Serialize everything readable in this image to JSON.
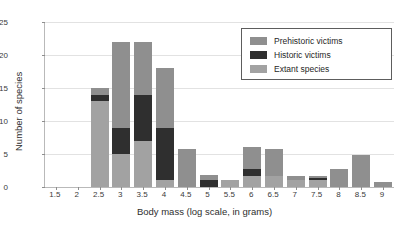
{
  "chart_data": {
    "type": "bar",
    "title": "",
    "xlabel": "Body mass (log scale, in grams)",
    "ylabel": "Number of species",
    "stacked": true,
    "grid": true,
    "legend_position": "top-right",
    "xlim": [
      1.25,
      9.25
    ],
    "ylim": [
      0,
      25
    ],
    "yticks": [
      0,
      5,
      10,
      15,
      20,
      25
    ],
    "categories": [
      "1.5",
      "2",
      "2.5",
      "3",
      "3.5",
      "4",
      "4.5",
      "5",
      "5.5",
      "6",
      "6.5",
      "7",
      "7.5",
      "8",
      "8.5",
      "9"
    ],
    "series": [
      {
        "name": "Extant species",
        "color": "#a2a2a2",
        "values": [
          0,
          0,
          13,
          5,
          7,
          1,
          0,
          0,
          1,
          1.7,
          1.7,
          1,
          1,
          0,
          0,
          0
        ]
      },
      {
        "name": "Historic victims",
        "color": "#2f2f2f",
        "values": [
          0,
          0,
          1,
          4,
          7,
          8,
          0,
          1,
          0,
          1,
          0,
          0,
          0.3,
          0,
          0,
          0
        ]
      },
      {
        "name": "Prehistoric victims",
        "color": "#8f8f8f",
        "values": [
          0,
          0,
          1,
          13,
          8,
          9,
          5.8,
          0.8,
          0,
          3.3,
          4.1,
          0.6,
          0.4,
          2.7,
          4.8,
          0.7
        ]
      }
    ],
    "totals": [
      0,
      0,
      15,
      22,
      22,
      18,
      5.8,
      1.8,
      1,
      6,
      5.8,
      1.6,
      1.7,
      2.7,
      4.8,
      0.7
    ]
  },
  "legend": {
    "entries": [
      {
        "label": "Prehistoric victims",
        "color": "#8f8f8f"
      },
      {
        "label": "Historic victims",
        "color": "#2f2f2f"
      },
      {
        "label": "Extant species",
        "color": "#a2a2a2"
      }
    ]
  }
}
